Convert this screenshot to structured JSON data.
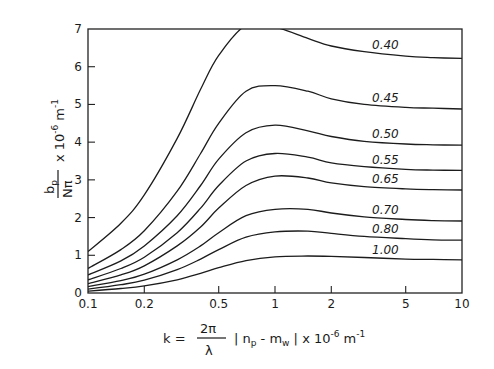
{
  "chart_data": {
    "type": "line",
    "title": "",
    "xlabel": "k = (2π/λ) |n_p − m_w| × 10^-6 m^-1",
    "ylabel": "b_p / (N π) × 10^-6 m^-1",
    "xscale": "log",
    "xlim": [
      0.1,
      10
    ],
    "ylim": [
      0,
      7
    ],
    "grid": false,
    "legend_position": "inline labels at right of each curve",
    "x_ticks": [
      "0.1",
      "0.2",
      "0.5",
      "1",
      "2",
      "5",
      "10"
    ],
    "y_ticks": [
      "0",
      "1",
      "2",
      "3",
      "4",
      "5",
      "6",
      "7"
    ],
    "x": [
      0.1,
      0.15,
      0.2,
      0.3,
      0.4,
      0.5,
      0.7,
      1.0,
      1.5,
      2.0,
      3.0,
      5.0,
      7.0,
      10.0
    ],
    "series": [
      {
        "name": "0.40",
        "values": [
          1.1,
          1.85,
          2.6,
          4.1,
          5.4,
          6.3,
          7.1,
          7.05,
          6.75,
          6.55,
          6.4,
          6.28,
          6.24,
          6.22
        ]
      },
      {
        "name": "0.45",
        "values": [
          0.65,
          1.15,
          1.65,
          2.7,
          3.7,
          4.5,
          5.35,
          5.5,
          5.35,
          5.15,
          5.0,
          4.92,
          4.9,
          4.88
        ]
      },
      {
        "name": "0.50",
        "values": [
          0.48,
          0.85,
          1.25,
          2.05,
          2.85,
          3.55,
          4.25,
          4.45,
          4.3,
          4.15,
          4.02,
          3.95,
          3.93,
          3.92
        ]
      },
      {
        "name": "0.55",
        "values": [
          0.35,
          0.65,
          0.95,
          1.6,
          2.25,
          2.85,
          3.5,
          3.7,
          3.6,
          3.45,
          3.35,
          3.28,
          3.26,
          3.25
        ]
      },
      {
        "name": "0.65",
        "values": [
          0.25,
          0.48,
          0.72,
          1.25,
          1.75,
          2.25,
          2.85,
          3.1,
          3.05,
          2.92,
          2.82,
          2.76,
          2.74,
          2.73
        ]
      },
      {
        "name": "0.70",
        "values": [
          0.17,
          0.33,
          0.5,
          0.88,
          1.25,
          1.6,
          2.05,
          2.22,
          2.22,
          2.12,
          2.02,
          1.95,
          1.92,
          1.91
        ]
      },
      {
        "name": "0.80",
        "values": [
          0.1,
          0.22,
          0.34,
          0.62,
          0.9,
          1.15,
          1.48,
          1.62,
          1.64,
          1.58,
          1.5,
          1.44,
          1.41,
          1.4
        ]
      },
      {
        "name": "1.00",
        "values": [
          0.05,
          0.12,
          0.19,
          0.35,
          0.52,
          0.67,
          0.86,
          0.96,
          0.98,
          0.97,
          0.94,
          0.9,
          0.89,
          0.88
        ]
      }
    ],
    "annotations": [
      "0.40",
      "0.45",
      "0.50",
      "0.55",
      "0.65",
      "0.70",
      "0.80",
      "1.00"
    ]
  },
  "axes": {
    "y_title": {
      "numerator": "b",
      "numerator_sub": "p",
      "denominator": "Nπ",
      "suffix": "x 10",
      "exp": "-6",
      "unit": "m",
      "unit_exp": "-1"
    },
    "x_title": {
      "prefix": "k =",
      "frac_num": "2π",
      "frac_den": "λ",
      "body": "| n",
      "body_sub1": "p",
      "mid": " - m",
      "body_sub2": "w",
      "close": " |  x 10",
      "exp": "-6",
      "unit": " m",
      "unit_exp": "-1"
    }
  }
}
